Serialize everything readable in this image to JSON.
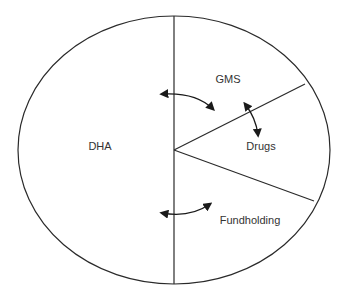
{
  "diagram": {
    "type": "funding-allocation-ellipse",
    "regions": [
      {
        "id": "dha",
        "label": "DHA",
        "x": 100,
        "y": 146
      },
      {
        "id": "gms",
        "label": "GMS",
        "x": 228,
        "y": 79
      },
      {
        "id": "drugs",
        "label": "Drugs",
        "x": 261,
        "y": 146
      },
      {
        "id": "fundholding",
        "label": "Fundholding",
        "x": 250,
        "y": 220
      }
    ],
    "arrows": [
      {
        "id": "dha-gms",
        "from": "DHA",
        "to": "GMS",
        "bidirectional": true
      },
      {
        "id": "gms-drugs",
        "from": "GMS",
        "to": "Drugs",
        "bidirectional": true
      },
      {
        "id": "dha-fundholding",
        "from": "DHA",
        "to": "Fundholding",
        "bidirectional": true
      }
    ],
    "colors": {
      "line": "#2a2a2a",
      "text": "#333333",
      "background": "#ffffff"
    }
  }
}
